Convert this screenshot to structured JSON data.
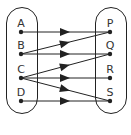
{
  "diagram": {
    "type": "mapping-diagram",
    "colors": {
      "stroke": "#222222",
      "text": "#333333",
      "background": "#ffffff"
    },
    "domain_set": {
      "elements": [
        {
          "label": "A",
          "x": 21,
          "y": 32
        },
        {
          "label": "B",
          "x": 21,
          "y": 54
        },
        {
          "label": "C",
          "x": 21,
          "y": 78
        },
        {
          "label": "D",
          "x": 21,
          "y": 101
        }
      ]
    },
    "codomain_set": {
      "elements": [
        {
          "label": "P",
          "x": 110,
          "y": 32
        },
        {
          "label": "Q",
          "x": 110,
          "y": 54
        },
        {
          "label": "R",
          "x": 110,
          "y": 78
        },
        {
          "label": "S",
          "x": 110,
          "y": 101
        }
      ]
    },
    "mappings": [
      {
        "from": "A",
        "to": "P"
      },
      {
        "from": "B",
        "to": "P"
      },
      {
        "from": "B",
        "to": "Q"
      },
      {
        "from": "C",
        "to": "Q"
      },
      {
        "from": "C",
        "to": "R"
      },
      {
        "from": "C",
        "to": "S"
      },
      {
        "from": "D",
        "to": "S"
      }
    ]
  }
}
